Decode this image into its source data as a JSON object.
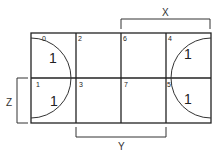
{
  "diagram": {
    "type": "karnaugh-map",
    "variables": [
      "X",
      "Y",
      "Z"
    ],
    "labels": {
      "x": "X",
      "y": "Y",
      "z": "Z"
    },
    "cells": [
      {
        "index": "0",
        "value": "1"
      },
      {
        "index": "2",
        "value": ""
      },
      {
        "index": "6",
        "value": ""
      },
      {
        "index": "4",
        "value": "1"
      },
      {
        "index": "1",
        "value": "1"
      },
      {
        "index": "3",
        "value": ""
      },
      {
        "index": "7",
        "value": ""
      },
      {
        "index": "5",
        "value": "1"
      }
    ],
    "groups": [
      "left-semicircle: cells 0,1",
      "right-semicircle: cells 4,5 (wraps with 0,1)"
    ]
  }
}
